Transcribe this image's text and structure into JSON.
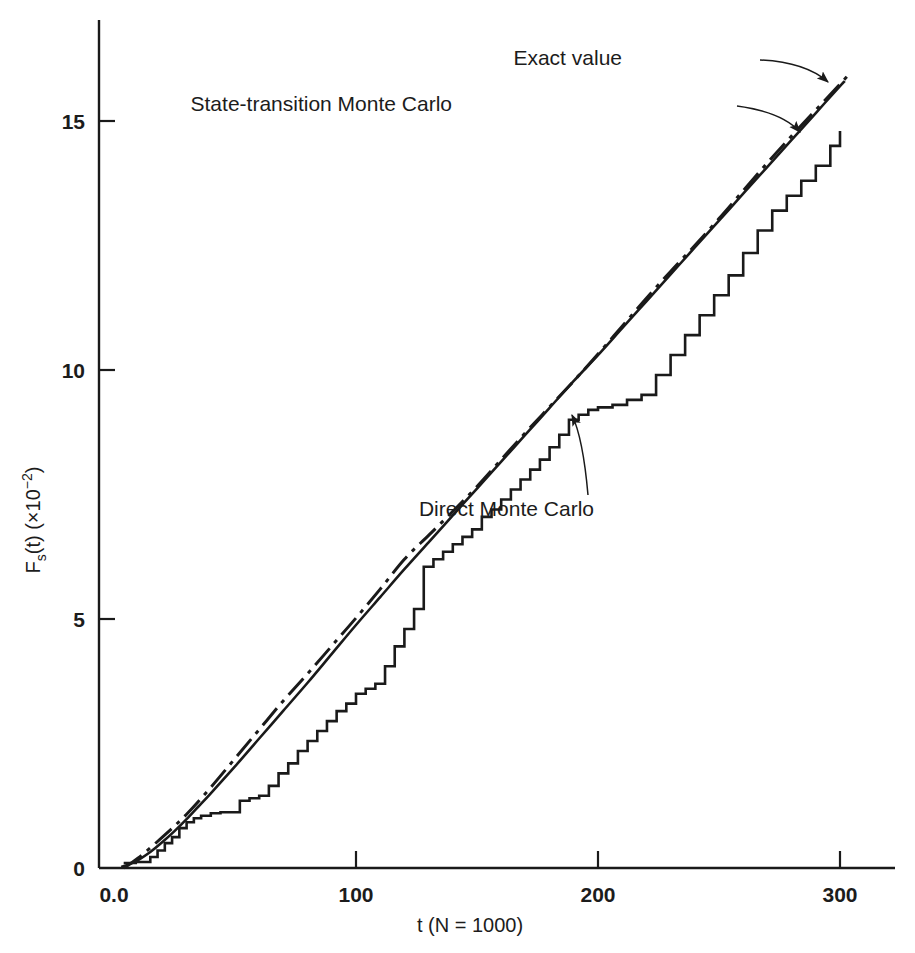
{
  "figure": {
    "background_color": "#ffffff",
    "ink_color": "#1a1a1a"
  },
  "chart_data": {
    "type": "line",
    "title": "",
    "subtitle": "",
    "xlabel": "t (N = 1000)",
    "ylabel": "F_s(t) (×10⁻²)",
    "ylabel_parts": {
      "main": "F",
      "subscript": "s",
      "after_sub": "(t) (×10",
      "superscript": "−2",
      "tail": ")"
    },
    "xlim": [
      0,
      320
    ],
    "ylim": [
      0,
      17.0
    ],
    "xticks": [
      0,
      100,
      200,
      300
    ],
    "xtick_labels": [
      "0.0",
      "100",
      "200",
      "300"
    ],
    "yticks": [
      0,
      5,
      10,
      15
    ],
    "ytick_labels": [
      "0",
      "5",
      "10",
      "15"
    ],
    "grid": false,
    "legend_position": "annotations-with-arrows",
    "annotations": [
      {
        "id": "exact-value",
        "text": "Exact value",
        "text_x": 622,
        "text_y": 65,
        "arrow_from": [
          760,
          60
        ],
        "arrow_ctrl": [
          805,
          62
        ],
        "arrow_to": [
          828,
          82
        ]
      },
      {
        "id": "state-transition-monte-carlo",
        "text": "State-transition Monte Carlo",
        "text_x": 452,
        "text_y": 111,
        "arrow_from": [
          737,
          106
        ],
        "arrow_ctrl": [
          782,
          112
        ],
        "arrow_to": [
          800,
          132
        ]
      },
      {
        "id": "direct-monte-carlo",
        "text": "Direct Monte Carlo",
        "text_x": 594,
        "text_y": 516,
        "arrow_from": [
          588,
          495
        ],
        "arrow_ctrl": [
          583,
          438
        ],
        "arrow_to": [
          572,
          415
        ]
      }
    ],
    "series": [
      {
        "name": "Exact value",
        "style": "solid",
        "linewidth": 2.6,
        "color": "#1a1a1a",
        "x": [
          3,
          6,
          10,
          15,
          20,
          25,
          30,
          35,
          40,
          50,
          60,
          70,
          80,
          90,
          100,
          110,
          120,
          130,
          140,
          150,
          160,
          170,
          180,
          190,
          200,
          210,
          220,
          230,
          240,
          250,
          260,
          270,
          280,
          290,
          300,
          302
        ],
        "y": [
          0.02,
          0.07,
          0.16,
          0.32,
          0.52,
          0.74,
          0.98,
          1.24,
          1.5,
          2.04,
          2.6,
          3.16,
          3.72,
          4.3,
          4.88,
          5.44,
          6.0,
          6.54,
          7.08,
          7.62,
          8.16,
          8.7,
          9.24,
          9.78,
          10.3,
          10.84,
          11.38,
          11.92,
          12.46,
          13.0,
          13.54,
          14.08,
          14.62,
          15.16,
          15.7,
          15.8
        ]
      },
      {
        "name": "State-transition Monte Carlo",
        "style": "dash-dot",
        "linewidth": 3.0,
        "color": "#1a1a1a",
        "x": [
          4,
          10,
          20,
          30,
          40,
          50,
          60,
          70,
          80,
          90,
          100,
          110,
          120,
          130,
          140,
          150,
          160,
          170,
          180,
          190,
          200,
          210,
          220,
          230,
          240,
          250,
          260,
          270,
          280,
          290,
          300,
          303
        ],
        "y": [
          0.0,
          0.2,
          0.62,
          1.08,
          1.62,
          2.2,
          2.78,
          3.36,
          3.9,
          4.46,
          5.02,
          5.6,
          6.2,
          6.68,
          7.16,
          7.66,
          8.2,
          8.74,
          9.26,
          9.78,
          10.32,
          10.88,
          11.44,
          11.98,
          12.5,
          13.04,
          13.6,
          14.16,
          14.7,
          15.22,
          15.74,
          15.9
        ]
      },
      {
        "name": "Direct Monte Carlo",
        "style": "step",
        "linewidth": 2.6,
        "color": "#1a1a1a",
        "x": [
          4,
          6,
          9,
          12,
          15,
          18,
          21,
          24,
          27,
          30,
          33,
          36,
          40,
          44,
          48,
          52,
          56,
          60,
          64,
          68,
          72,
          76,
          80,
          84,
          88,
          92,
          96,
          100,
          104,
          108,
          112,
          116,
          120,
          124,
          128,
          132,
          136,
          140,
          144,
          148,
          152,
          156,
          160,
          164,
          168,
          172,
          176,
          180,
          184,
          188,
          192,
          196,
          200,
          206,
          212,
          218,
          224,
          230,
          236,
          242,
          248,
          254,
          260,
          266,
          272,
          278,
          284,
          290,
          296,
          300
        ],
        "y": [
          0.1,
          0.1,
          0.12,
          0.12,
          0.22,
          0.35,
          0.5,
          0.62,
          0.8,
          0.92,
          1.0,
          1.05,
          1.1,
          1.12,
          1.12,
          1.35,
          1.4,
          1.45,
          1.65,
          1.9,
          2.1,
          2.35,
          2.55,
          2.75,
          2.95,
          3.15,
          3.3,
          3.5,
          3.6,
          3.7,
          4.05,
          4.45,
          4.8,
          5.2,
          6.05,
          6.2,
          6.35,
          6.5,
          6.65,
          6.8,
          7.05,
          7.2,
          7.4,
          7.6,
          7.8,
          8.0,
          8.2,
          8.45,
          8.7,
          9.0,
          9.1,
          9.2,
          9.25,
          9.3,
          9.4,
          9.5,
          9.9,
          10.3,
          10.7,
          11.1,
          11.5,
          11.9,
          12.35,
          12.8,
          13.2,
          13.5,
          13.8,
          14.1,
          14.5,
          14.8
        ]
      }
    ]
  },
  "axes_geometry": {
    "x_left_px": 99,
    "x_right_px": 895,
    "y_top_px": 20,
    "y_bottom_px": 868,
    "x0_px": 114,
    "x_per_unit_px": 2.42,
    "y0_px": 868,
    "y_per_unit_px": 49.8
  }
}
